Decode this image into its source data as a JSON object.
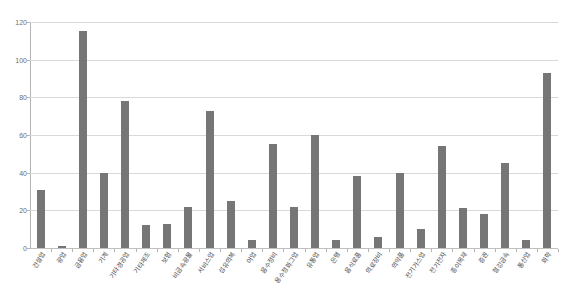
{
  "chart_data": {
    "type": "bar",
    "title": "",
    "xlabel": "",
    "ylabel": "",
    "ylim": [
      0,
      120
    ],
    "y_ticks": [
      0,
      20,
      40,
      60,
      80,
      100,
      120
    ],
    "grid": true,
    "legend": "none",
    "bar_color": "#767676",
    "gridline_color": "#d9d9d9",
    "axis_color": "#b4b4b4",
    "categories": [
      "건설업",
      "광업",
      "금융업",
      "기계",
      "기타경공업",
      "기타제조",
      "보험",
      "비금속광물",
      "서비스업",
      "섬유의복",
      "어업",
      "음수정비",
      "용수정화그업",
      "유통업",
      "은행",
      "음식료품",
      "의료장비",
      "의약품",
      "전기가스업",
      "전기전자",
      "종이목재",
      "증권",
      "철강금속",
      "통신업",
      "화학"
    ],
    "values": [
      31,
      1,
      115,
      40,
      78,
      12,
      13,
      22,
      73,
      25,
      4,
      55,
      22,
      60,
      4,
      38,
      6,
      40,
      10,
      54,
      21,
      18,
      45,
      4,
      93
    ]
  }
}
